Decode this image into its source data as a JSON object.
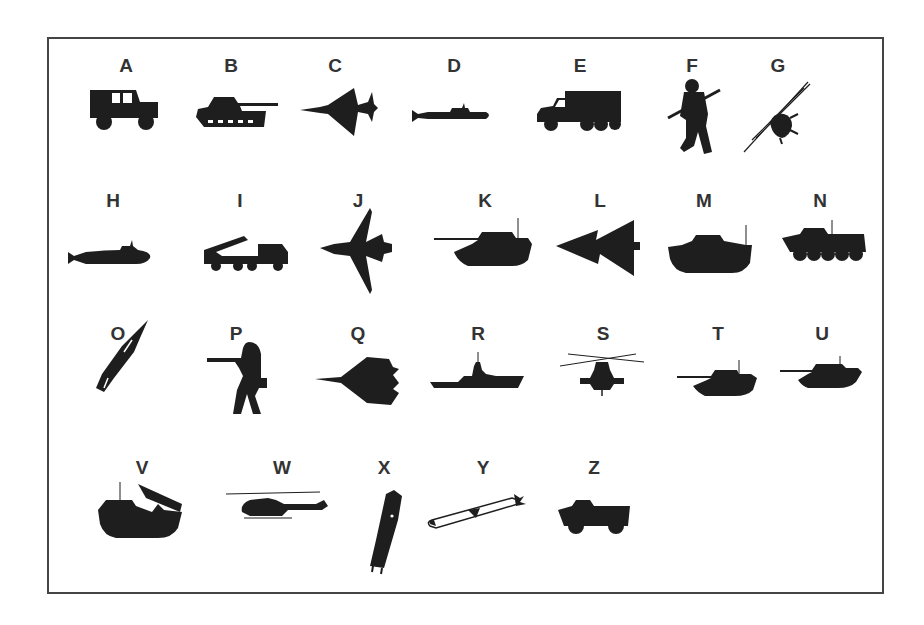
{
  "figure": {
    "border_color": "#444444",
    "silhouette_color": "#1e1e1e",
    "label_color": "#333333",
    "items": [
      {
        "letter": "A",
        "icon": "jeep-icon",
        "desc": "Military jeep"
      },
      {
        "letter": "B",
        "icon": "tank-icon",
        "desc": "Tank with long gun"
      },
      {
        "letter": "C",
        "icon": "delta-wing-jet-icon",
        "desc": "Delta-wing fighter jet"
      },
      {
        "letter": "D",
        "icon": "submarine-icon",
        "desc": "Submarine"
      },
      {
        "letter": "E",
        "icon": "military-truck-icon",
        "desc": "Cargo truck"
      },
      {
        "letter": "F",
        "icon": "soldier-with-rifle-icon",
        "desc": "Soldier holding rifle"
      },
      {
        "letter": "G",
        "icon": "helicopter-top-view-icon",
        "desc": "Helicopter viewed from above"
      },
      {
        "letter": "H",
        "icon": "submarine-icon",
        "desc": "Submarine"
      },
      {
        "letter": "I",
        "icon": "rocket-launcher-truck-icon",
        "desc": "Multiple rocket launcher truck"
      },
      {
        "letter": "J",
        "icon": "swing-wing-jet-icon",
        "desc": "Swing-wing fighter jet"
      },
      {
        "letter": "K",
        "icon": "tank-icon",
        "desc": "Main battle tank"
      },
      {
        "letter": "L",
        "icon": "double-delta-jet-icon",
        "desc": "Double-delta jet"
      },
      {
        "letter": "M",
        "icon": "amphibious-vehicle-icon",
        "desc": "Amphibious armored vehicle"
      },
      {
        "letter": "N",
        "icon": "wheeled-apc-icon",
        "desc": "8-wheeled APC"
      },
      {
        "letter": "O",
        "icon": "missile-icon",
        "desc": "Missile, angled"
      },
      {
        "letter": "P",
        "icon": "soldier-aiming-icon",
        "desc": "Soldier aiming rifle"
      },
      {
        "letter": "Q",
        "icon": "fighter-jet-top-icon",
        "desc": "Fighter jet top view"
      },
      {
        "letter": "R",
        "icon": "warship-icon",
        "desc": "Warship"
      },
      {
        "letter": "S",
        "icon": "attack-helicopter-front-icon",
        "desc": "Attack helicopter front view"
      },
      {
        "letter": "T",
        "icon": "tank-icon",
        "desc": "Tank"
      },
      {
        "letter": "U",
        "icon": "tank-icon",
        "desc": "Tank"
      },
      {
        "letter": "V",
        "icon": "amphibious-launcher-icon",
        "desc": "Amphibious rocket launcher"
      },
      {
        "letter": "W",
        "icon": "attack-helicopter-side-icon",
        "desc": "Attack helicopter side view"
      },
      {
        "letter": "X",
        "icon": "rocket-icon",
        "desc": "Rocket"
      },
      {
        "letter": "Y",
        "icon": "cruise-missile-icon",
        "desc": "Cruise missile"
      },
      {
        "letter": "Z",
        "icon": "armored-car-icon",
        "desc": "Armored car"
      }
    ]
  }
}
